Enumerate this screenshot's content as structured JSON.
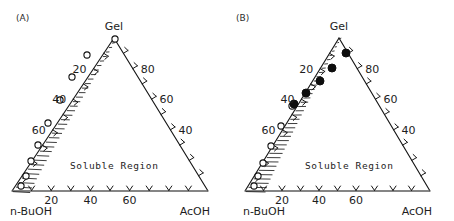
{
  "figure": {
    "background": "#ffffff",
    "ink": "#161616",
    "width": 454,
    "height": 221
  },
  "panels": [
    {
      "tag": "(A)",
      "tag_pos": [
        18,
        21
      ],
      "vertices": {
        "left": [
          12,
          191
        ],
        "right": [
          208,
          191
        ],
        "apex": [
          114,
          38
        ]
      },
      "vertex_labels": {
        "top": "Gel",
        "bottom_left": "n-BuOH",
        "bottom_right": "AcOH"
      },
      "region_label": "Soluble Region",
      "region_label_pos": [
        70,
        169
      ],
      "axis_ticks": {
        "bottom": [
          10,
          20,
          30,
          40,
          50,
          60,
          70,
          80,
          90
        ],
        "left": [
          10,
          20,
          30,
          40,
          50,
          60,
          70,
          80,
          90
        ],
        "right": [
          10,
          20,
          30,
          40,
          50,
          60,
          70,
          80,
          90
        ]
      },
      "tick_labels": {
        "bottom": [
          {
            "value": 20,
            "text": "20"
          },
          {
            "value": 40,
            "text": "40"
          },
          {
            "value": 60,
            "text": "60"
          }
        ],
        "left": [
          {
            "value": 20,
            "text": "20"
          },
          {
            "value": 40,
            "text": "40"
          },
          {
            "value": 60,
            "text": "60"
          }
        ],
        "right": [
          {
            "value": 80,
            "text": "80"
          },
          {
            "value": 60,
            "text": "60"
          },
          {
            "value": 40,
            "text": "40"
          }
        ]
      },
      "gel_band": {
        "style": "hatched",
        "hatch_count": 34,
        "inner_offset_bottom": 16,
        "inner_offset_top": 3
      },
      "data_points": {
        "marker": "open-circle",
        "radius": 3.1,
        "points": [
          [
            21,
            186
          ],
          [
            26,
            176
          ],
          [
            31,
            161
          ],
          [
            38,
            145
          ],
          [
            48,
            123
          ],
          [
            60,
            100
          ],
          [
            72,
            77
          ],
          [
            87,
            55
          ],
          [
            115,
            39
          ]
        ]
      }
    },
    {
      "tag": "(B)",
      "tag_pos": [
        236,
        21
      ],
      "vertices": {
        "left": [
          245,
          191
        ],
        "right": [
          430,
          191
        ],
        "apex": [
          339,
          38
        ]
      },
      "vertex_labels": {
        "top": "Gel",
        "bottom_left": "n-BuOH",
        "bottom_right": "AcOH"
      },
      "region_label": "Soluble Region",
      "region_label_pos": [
        305,
        169
      ],
      "axis_ticks": {
        "bottom": [
          10,
          20,
          30,
          40,
          50,
          60,
          70,
          80,
          90
        ],
        "left": [
          10,
          20,
          30,
          40,
          50,
          60,
          70,
          80,
          90
        ],
        "right": [
          10,
          20,
          30,
          40,
          50,
          60,
          70,
          80,
          90
        ]
      },
      "tick_labels": {
        "bottom": [
          {
            "value": 20,
            "text": "20"
          },
          {
            "value": 40,
            "text": "40"
          },
          {
            "value": 60,
            "text": "60"
          }
        ],
        "left": [
          {
            "value": 20,
            "text": "20"
          },
          {
            "value": 40,
            "text": "40"
          },
          {
            "value": 60,
            "text": "60"
          }
        ],
        "right": [
          {
            "value": 80,
            "text": "80"
          },
          {
            "value": 60,
            "text": "60"
          },
          {
            "value": 40,
            "text": "40"
          }
        ]
      },
      "gel_band": {
        "style": "hatched-tapered",
        "hatch_count": 36,
        "inner_offset_bottom": 18,
        "inner_offset_top": 2
      },
      "data_points_open": {
        "marker": "open-circle",
        "radius": 3.1,
        "points": [
          [
            254,
            186
          ],
          [
            258,
            176
          ],
          [
            263,
            163
          ],
          [
            271,
            146
          ],
          [
            281,
            126
          ],
          [
            292,
            106
          ]
        ]
      },
      "data_points_solid": {
        "marker": "solid-circle",
        "radius": 4.0,
        "points": [
          [
            294,
            104
          ],
          [
            306,
            93
          ],
          [
            320,
            81
          ],
          [
            332,
            68
          ],
          [
            346,
            53
          ]
        ]
      }
    }
  ],
  "chart_data": {
    "type": "scatter",
    "title": "",
    "subtitle": "",
    "diagram": "ternary-phase-diagram",
    "panel_count": 2,
    "components": [
      "n-BuOH",
      "AcOH",
      "Gel"
    ],
    "axis_range": [
      0,
      100
    ],
    "axis_tick_interval": 10,
    "labeled_ticks": [
      20,
      40,
      60,
      80
    ],
    "grid": false,
    "legend_position": "none",
    "annotations": [
      "Soluble Region",
      "(A)",
      "(B)"
    ],
    "series": [
      {
        "panel": "(A)",
        "name": "Gel boundary (A)",
        "marker": "open-circle",
        "note": "Hatched gel band lies along the n-BuOH–Gel edge; below/right of it is the soluble region.",
        "points_ternary": [
          {
            "n_BuOH": 95,
            "AcOH": 2,
            "Gel": 3
          },
          {
            "n_BuOH": 88,
            "AcOH": 2,
            "Gel": 10
          },
          {
            "n_BuOH": 80,
            "AcOH": 2,
            "Gel": 18
          },
          {
            "n_BuOH": 70,
            "AcOH": 3,
            "Gel": 27
          },
          {
            "n_BuOH": 58,
            "AcOH": 3,
            "Gel": 39
          },
          {
            "n_BuOH": 45,
            "AcOH": 4,
            "Gel": 51
          },
          {
            "n_BuOH": 33,
            "AcOH": 4,
            "Gel": 63
          },
          {
            "n_BuOH": 21,
            "AcOH": 4,
            "Gel": 75
          },
          {
            "n_BuOH": 2,
            "AcOH": 2,
            "Gel": 96
          }
        ]
      },
      {
        "panel": "(B)",
        "name": "Gel boundary lower (B)",
        "marker": "open-circle",
        "points_ternary": [
          {
            "n_BuOH": 95,
            "AcOH": 2,
            "Gel": 3
          },
          {
            "n_BuOH": 89,
            "AcOH": 2,
            "Gel": 9
          },
          {
            "n_BuOH": 82,
            "AcOH": 2,
            "Gel": 16
          },
          {
            "n_BuOH": 72,
            "AcOH": 3,
            "Gel": 25
          },
          {
            "n_BuOH": 61,
            "AcOH": 4,
            "Gel": 35
          },
          {
            "n_BuOH": 50,
            "AcOH": 5,
            "Gel": 45
          }
        ]
      },
      {
        "panel": "(B)",
        "name": "Gel boundary upper (B)",
        "marker": "solid-circle",
        "points_ternary": [
          {
            "n_BuOH": 49,
            "AcOH": 5,
            "Gel": 46
          },
          {
            "n_BuOH": 40,
            "AcOH": 8,
            "Gel": 52
          },
          {
            "n_BuOH": 31,
            "AcOH": 12,
            "Gel": 57
          },
          {
            "n_BuOH": 24,
            "AcOH": 16,
            "Gel": 60
          },
          {
            "n_BuOH": 15,
            "AcOH": 20,
            "Gel": 65
          }
        ]
      }
    ]
  }
}
